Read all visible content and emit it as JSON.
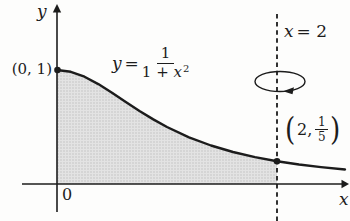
{
  "figure": {
    "colors": {
      "paper": "#fdfdfc",
      "ink": "#1c1c1c",
      "shadebg": "#e3e3e3",
      "shadedot": "#c3c3c3"
    }
  },
  "labels": {
    "y_axis": "y",
    "x_axis": "x",
    "origin": "0",
    "point_top": "(0, 1)",
    "rot_axis": {
      "var": "x",
      "rest": "= 2"
    },
    "curve": {
      "lhs": "y",
      "eq": "=",
      "num": "1",
      "den_pre": "1 +",
      "den_var": "x",
      "den_exp": "2"
    },
    "point_right": {
      "open": "(",
      "val": "2,",
      "num": "1",
      "den": "5",
      "close": ")"
    }
  }
}
